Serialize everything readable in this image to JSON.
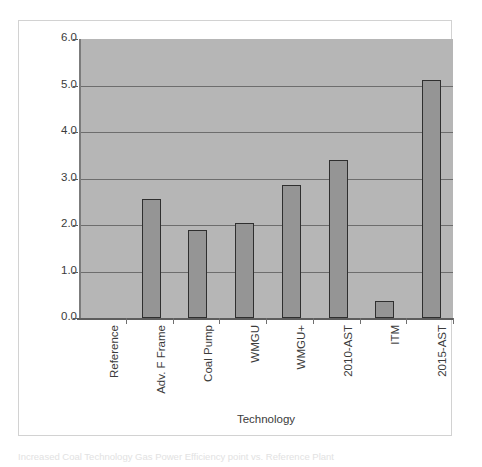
{
  "chart_data": {
    "type": "bar",
    "title": "",
    "xlabel": "Technology",
    "ylabel": "Percentage Points",
    "ylim": [
      0.0,
      6.0
    ],
    "ytick_labels": [
      "6.0",
      "5.0",
      "4.0",
      "3.0",
      "2.0",
      "1.0",
      "0.0"
    ],
    "ytick_values": [
      6.0,
      5.0,
      4.0,
      3.0,
      2.0,
      1.0,
      0.0
    ],
    "grid": true,
    "gridlines_at": [
      5.0,
      4.0,
      3.0,
      2.0,
      1.0
    ],
    "legend": null,
    "categories": [
      "Reference",
      "Adv. F Frame",
      "Coal Pump",
      "WMGU",
      "WMGU+",
      "2010-AST",
      "ITM",
      "2015-AST"
    ],
    "values": [
      0.0,
      2.55,
      1.9,
      2.05,
      2.87,
      3.4,
      0.37,
      5.12
    ],
    "series": [
      {
        "name": "Efficiency gain",
        "values": [
          0.0,
          2.55,
          1.9,
          2.05,
          2.87,
          3.4,
          0.37,
          5.12
        ]
      }
    ],
    "colors": {
      "bar_fill": "#959595",
      "bar_border": "#2f2f2f",
      "plot_background": "#b6b6b6",
      "gridline": "#6d6d6d",
      "axis_line": "#5d5d5d",
      "text": "#3b3b3b",
      "figure_background": "#ffffff",
      "figure_border": "#d2d2d2"
    }
  },
  "caption": {
    "text": "Increased Coal Technology Gas Power Efficiency point vs. Reference Plant"
  }
}
